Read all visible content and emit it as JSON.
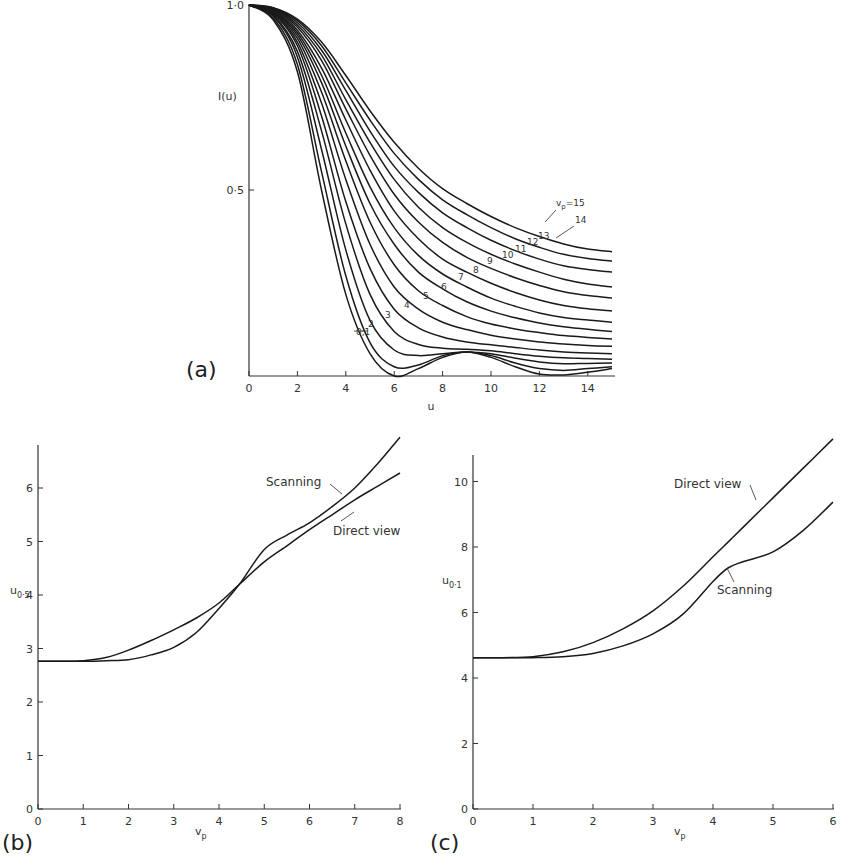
{
  "chart_data": [
    {
      "id": "a",
      "panel_label": "(a)",
      "type": "line",
      "title": "",
      "xlabel": "u",
      "ylabel": "I(u)",
      "xlim": [
        0,
        15
      ],
      "ylim": [
        0,
        1.0
      ],
      "x_ticks": [
        0,
        2,
        4,
        6,
        8,
        10,
        12,
        14
      ],
      "y_ticks": [
        {
          "value": 0.5,
          "label": "0·5"
        },
        {
          "value": 1.0,
          "label": "1·0"
        }
      ],
      "grid": false,
      "legend": "inline labels along curves",
      "annotation": "vp=15",
      "x": [
        0,
        1,
        2,
        3,
        4,
        5,
        6,
        7,
        8,
        9,
        10,
        11,
        12,
        13,
        14,
        15
      ],
      "series": [
        {
          "name": "0,1",
          "values": [
            1.0,
            0.96,
            0.82,
            0.5,
            0.22,
            0.06,
            0.0,
            0.02,
            0.05,
            0.065,
            0.05,
            0.025,
            0.005,
            0.003,
            0.01,
            0.02
          ]
        },
        {
          "name": "2",
          "values": [
            1.0,
            0.965,
            0.84,
            0.55,
            0.27,
            0.09,
            0.025,
            0.03,
            0.055,
            0.065,
            0.055,
            0.035,
            0.02,
            0.015,
            0.02,
            0.025
          ]
        },
        {
          "name": "3",
          "values": [
            1.0,
            0.97,
            0.86,
            0.61,
            0.34,
            0.15,
            0.07,
            0.055,
            0.06,
            0.065,
            0.06,
            0.048,
            0.038,
            0.033,
            0.034,
            0.035
          ]
        },
        {
          "name": "4",
          "values": [
            1.0,
            0.972,
            0.875,
            0.66,
            0.41,
            0.22,
            0.12,
            0.085,
            0.075,
            0.072,
            0.068,
            0.06,
            0.053,
            0.049,
            0.047,
            0.045
          ]
        },
        {
          "name": "5",
          "values": [
            1.0,
            0.975,
            0.89,
            0.7,
            0.47,
            0.29,
            0.18,
            0.13,
            0.105,
            0.092,
            0.084,
            0.077,
            0.07,
            0.065,
            0.062,
            0.06
          ]
        },
        {
          "name": "6",
          "values": [
            1.0,
            0.978,
            0.9,
            0.735,
            0.53,
            0.355,
            0.24,
            0.18,
            0.145,
            0.125,
            0.11,
            0.1,
            0.092,
            0.086,
            0.082,
            0.08
          ]
        },
        {
          "name": "7",
          "values": [
            1.0,
            0.98,
            0.91,
            0.765,
            0.58,
            0.415,
            0.3,
            0.23,
            0.19,
            0.16,
            0.14,
            0.127,
            0.117,
            0.109,
            0.104,
            0.1
          ]
        },
        {
          "name": "8",
          "values": [
            1.0,
            0.982,
            0.918,
            0.79,
            0.62,
            0.465,
            0.355,
            0.28,
            0.235,
            0.2,
            0.175,
            0.157,
            0.143,
            0.133,
            0.126,
            0.12
          ]
        },
        {
          "name": "9",
          "values": [
            1.0,
            0.984,
            0.925,
            0.81,
            0.655,
            0.51,
            0.4,
            0.325,
            0.275,
            0.24,
            0.21,
            0.188,
            0.17,
            0.158,
            0.151,
            0.145
          ]
        },
        {
          "name": "10",
          "values": [
            1.0,
            0.986,
            0.932,
            0.83,
            0.69,
            0.555,
            0.445,
            0.37,
            0.315,
            0.28,
            0.25,
            0.225,
            0.205,
            0.19,
            0.181,
            0.175
          ]
        },
        {
          "name": "11",
          "values": [
            1.0,
            0.988,
            0.94,
            0.85,
            0.72,
            0.595,
            0.49,
            0.415,
            0.36,
            0.32,
            0.29,
            0.265,
            0.244,
            0.227,
            0.217,
            0.21
          ]
        },
        {
          "name": "12",
          "values": [
            1.0,
            0.99,
            0.946,
            0.865,
            0.745,
            0.63,
            0.53,
            0.455,
            0.4,
            0.36,
            0.328,
            0.302,
            0.28,
            0.261,
            0.248,
            0.24
          ]
        },
        {
          "name": "13",
          "values": [
            1.0,
            0.991,
            0.952,
            0.878,
            0.77,
            0.66,
            0.565,
            0.495,
            0.44,
            0.4,
            0.366,
            0.338,
            0.315,
            0.297,
            0.287,
            0.28
          ]
        },
        {
          "name": "14",
          "values": [
            1.0,
            0.992,
            0.958,
            0.89,
            0.79,
            0.69,
            0.6,
            0.53,
            0.475,
            0.435,
            0.4,
            0.37,
            0.347,
            0.328,
            0.317,
            0.31
          ]
        },
        {
          "name": "15",
          "values": [
            1.0,
            0.993,
            0.962,
            0.9,
            0.81,
            0.715,
            0.63,
            0.56,
            0.505,
            0.465,
            0.43,
            0.4,
            0.376,
            0.356,
            0.342,
            0.335
          ]
        }
      ],
      "curve_labels": [
        {
          "text": "0,1",
          "u": 4.6,
          "I": 0.12
        },
        {
          "text": "2",
          "u": 5.1,
          "I": 0.17
        },
        {
          "text": "3",
          "u": 5.6,
          "I": 0.22
        },
        {
          "text": "4",
          "u": 6.4,
          "I": 0.27
        },
        {
          "text": "5",
          "u": 7.3,
          "I": 0.32
        },
        {
          "text": "6",
          "u": 8.0,
          "I": 0.35
        },
        {
          "text": "7",
          "u": 8.8,
          "I": 0.38
        },
        {
          "text": "8",
          "u": 9.4,
          "I": 0.41
        },
        {
          "text": "9",
          "u": 9.9,
          "I": 0.44
        },
        {
          "text": "10",
          "u": 10.7,
          "I": 0.46
        },
        {
          "text": "11",
          "u": 11.1,
          "I": 0.48
        },
        {
          "text": "12",
          "u": 11.8,
          "I": 0.5
        },
        {
          "text": "13",
          "u": 12.3,
          "I": 0.52
        },
        {
          "text": "14",
          "u": 13.4,
          "I": 0.56
        },
        {
          "text": "vp=15",
          "u": 12.8,
          "I": 0.6
        }
      ]
    },
    {
      "id": "b",
      "panel_label": "(b)",
      "type": "line",
      "title": "",
      "xlabel": "vp",
      "ylabel": "u0·5",
      "xlim": [
        0,
        8
      ],
      "ylim": [
        0,
        7
      ],
      "x_ticks": [
        0,
        1,
        2,
        3,
        4,
        5,
        6,
        7,
        8
      ],
      "y_ticks": [
        0,
        1,
        2,
        3,
        4,
        5,
        6
      ],
      "grid": false,
      "legend": "inline labels",
      "x": [
        0,
        0.5,
        1,
        1.5,
        2,
        2.5,
        3,
        3.5,
        4,
        4.45,
        5,
        5.5,
        6,
        6.5,
        7,
        7.5,
        8
      ],
      "series": [
        {
          "name": "Scanning",
          "values": [
            2.76,
            2.76,
            2.76,
            2.77,
            2.79,
            2.88,
            3.02,
            3.3,
            3.75,
            4.2,
            4.85,
            5.12,
            5.35,
            5.65,
            6.0,
            6.45,
            6.95
          ]
        },
        {
          "name": "Direct view",
          "values": [
            2.76,
            2.76,
            2.77,
            2.83,
            2.97,
            3.15,
            3.35,
            3.57,
            3.85,
            4.2,
            4.62,
            4.92,
            5.22,
            5.5,
            5.78,
            6.03,
            6.28
          ]
        }
      ],
      "annotations": [
        "Scanning",
        "Direct view"
      ]
    },
    {
      "id": "c",
      "panel_label": "(c)",
      "type": "line",
      "title": "",
      "xlabel": "vp",
      "ylabel": "u0·1",
      "xlim": [
        0,
        6
      ],
      "ylim": [
        0,
        11
      ],
      "x_ticks": [
        0,
        1,
        2,
        3,
        4,
        5,
        6
      ],
      "y_ticks": [
        0,
        2,
        4,
        6,
        8,
        10
      ],
      "grid": false,
      "legend": "inline labels",
      "x": [
        0,
        0.5,
        1,
        1.5,
        2,
        2.5,
        3,
        3.5,
        4,
        4.25,
        4.5,
        5,
        5.5,
        6
      ],
      "series": [
        {
          "name": "Direct view",
          "values": [
            4.62,
            4.62,
            4.65,
            4.8,
            5.08,
            5.5,
            6.05,
            6.8,
            7.7,
            8.15,
            8.6,
            9.5,
            10.4,
            11.3
          ]
        },
        {
          "name": "Scanning",
          "values": [
            4.62,
            4.62,
            4.62,
            4.65,
            4.75,
            4.98,
            5.35,
            5.95,
            6.95,
            7.36,
            7.55,
            7.85,
            8.5,
            9.37
          ]
        }
      ],
      "annotations": [
        "Direct view",
        "Scanning"
      ]
    }
  ],
  "labels": {
    "a": {
      "panel": "(a)",
      "ylabel": "I(u)",
      "xlabel": "u",
      "y1": "1·0",
      "y05": "0·5",
      "x_ticks": [
        "0",
        "2",
        "4",
        "6",
        "8",
        "10",
        "12",
        "14"
      ],
      "vp_main": "v",
      "vp_sub": "p",
      "vp_rest": "=15",
      "curve_labels": [
        "0,1",
        "2",
        "3",
        "4",
        "5",
        "6",
        "7",
        "8",
        "9",
        "10",
        "11",
        "12",
        "13",
        "14"
      ]
    },
    "b": {
      "panel": "(b)",
      "ylabel_main": "u",
      "ylabel_sub": "0·5",
      "xlabel_main": "v",
      "xlabel_sub": "p",
      "x_ticks": [
        "0",
        "1",
        "2",
        "3",
        "4",
        "5",
        "6",
        "7",
        "8"
      ],
      "y_ticks": [
        "0",
        "1",
        "2",
        "3",
        "4",
        "5",
        "6"
      ],
      "scanning": "Scanning",
      "direct": "Direct view"
    },
    "c": {
      "panel": "(c)",
      "ylabel_main": "u",
      "ylabel_sub": "0·1",
      "xlabel_main": "v",
      "xlabel_sub": "p",
      "x_ticks": [
        "0",
        "1",
        "2",
        "3",
        "4",
        "5",
        "6"
      ],
      "y_ticks": [
        "0",
        "2",
        "4",
        "6",
        "8",
        "10"
      ],
      "scanning": "Scanning",
      "direct": "Direct view"
    }
  }
}
